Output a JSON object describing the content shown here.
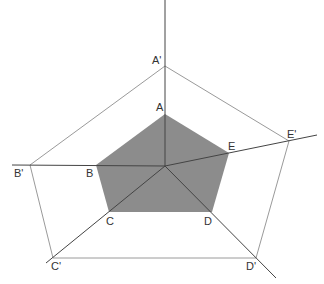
{
  "diagram": {
    "colors": {
      "inner_fill": "#8c8c8c",
      "rays": "#444444",
      "outer": "#9a9a9a",
      "label": "#333333"
    },
    "center": [
      165,
      166
    ],
    "inner_pentagon": {
      "points": [
        {
          "label": "A",
          "x": 165,
          "y": 114,
          "lx": 156,
          "ly": 111
        },
        {
          "label": "B",
          "x": 96,
          "y": 165,
          "lx": 86,
          "ly": 177
        },
        {
          "label": "C",
          "x": 109,
          "y": 212,
          "lx": 106,
          "ly": 225
        },
        {
          "label": "D",
          "x": 212,
          "y": 212,
          "lx": 204,
          "ly": 225
        },
        {
          "label": "E",
          "x": 229,
          "y": 153,
          "lx": 228,
          "ly": 150
        }
      ]
    },
    "outer_pentagon": {
      "points": [
        {
          "label": "A'",
          "x": 165,
          "y": 66,
          "lx": 152,
          "ly": 64
        },
        {
          "label": "B'",
          "x": 30,
          "y": 165,
          "lx": 14,
          "ly": 177
        },
        {
          "label": "C'",
          "x": 53,
          "y": 258,
          "lx": 51,
          "ly": 270
        },
        {
          "label": "D'",
          "x": 256,
          "y": 258,
          "lx": 246,
          "ly": 270
        },
        {
          "label": "E'",
          "x": 289,
          "y": 141,
          "lx": 287,
          "ly": 138
        }
      ]
    },
    "rays": [
      {
        "name": "ray-a",
        "x2": 165,
        "y2": 0
      },
      {
        "name": "ray-b",
        "x2": 12,
        "y2": 165
      },
      {
        "name": "ray-c",
        "x2": 46,
        "y2": 263
      },
      {
        "name": "ray-d",
        "x2": 276,
        "y2": 278
      },
      {
        "name": "ray-e",
        "x2": 317,
        "y2": 135
      }
    ]
  }
}
